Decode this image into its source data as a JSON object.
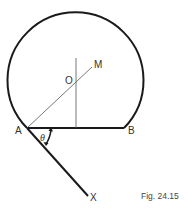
{
  "figure": {
    "caption": "Fig. 24.15",
    "colors": {
      "stroke": "#1a1a1a",
      "thin_stroke": "#555555",
      "text": "#333333",
      "background": "#ffffff"
    },
    "points": {
      "A": {
        "label": "A"
      },
      "B": {
        "label": "B"
      },
      "O": {
        "label": "O"
      },
      "M": {
        "label": "M"
      },
      "X": {
        "label": "X"
      }
    },
    "angle": {
      "label": "θ",
      "between": [
        "AB",
        "AX"
      ]
    },
    "elements": [
      "circular arc from A to B (major arc)",
      "chord AB",
      "perpendicular bisector of AB through O",
      "line AM through center O",
      "line AX below chord",
      "angle arrow θ between AB and AX"
    ]
  }
}
